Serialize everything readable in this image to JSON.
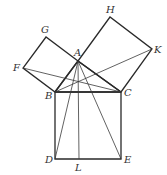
{
  "diagram": {
    "points": {
      "A": {
        "x": 78,
        "y": 61
      },
      "B": {
        "x": 55,
        "y": 92
      },
      "C": {
        "x": 121,
        "y": 92
      },
      "D": {
        "x": 55,
        "y": 159
      },
      "E": {
        "x": 121,
        "y": 159
      },
      "L": {
        "x": 79,
        "y": 159
      },
      "F": {
        "x": 23,
        "y": 68
      },
      "G": {
        "x": 46,
        "y": 37
      },
      "H": {
        "x": 110,
        "y": 17
      },
      "K": {
        "x": 152,
        "y": 49
      }
    },
    "labels": {
      "A": "A",
      "B": "B",
      "C": "C",
      "D": "D",
      "E": "E",
      "F": "F",
      "G": "G",
      "H": "H",
      "K": "K",
      "L": "L"
    },
    "squares": [
      {
        "name": "square-BCED",
        "vertices": [
          "B",
          "C",
          "E",
          "D"
        ]
      },
      {
        "name": "square-ABFG",
        "vertices": [
          "A",
          "G",
          "F",
          "B"
        ]
      },
      {
        "name": "square-ACKH",
        "vertices": [
          "A",
          "H",
          "K",
          "C"
        ]
      }
    ],
    "segments": [
      [
        "A",
        "B"
      ],
      [
        "A",
        "C"
      ],
      [
        "B",
        "C"
      ],
      [
        "A",
        "L"
      ],
      [
        "A",
        "D"
      ],
      [
        "A",
        "E"
      ],
      [
        "F",
        "C"
      ],
      [
        "B",
        "K"
      ]
    ],
    "colors": {
      "stroke": "#2a2a2a",
      "label": "#333333",
      "background": "#ffffff"
    }
  }
}
